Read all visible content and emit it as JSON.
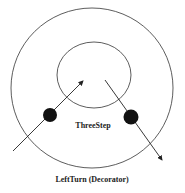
{
  "diagram": {
    "outer_circle": {
      "label": "LeftTurn (Decorator)"
    },
    "inner_circle": {
      "label": "ThreeStep"
    },
    "colors": {
      "stroke": "#333333",
      "dot": "#111111",
      "background": "#ffffff"
    }
  }
}
